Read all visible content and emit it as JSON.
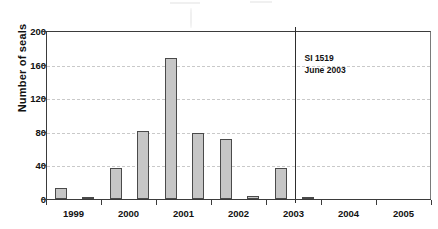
{
  "chart_data": {
    "type": "bar",
    "title": "",
    "xlabel": "",
    "ylabel": "Number of seals",
    "ylim": [
      0,
      200
    ],
    "yticks": [
      0,
      40,
      80,
      120,
      160,
      200
    ],
    "grid": true,
    "legend": null,
    "categories": [
      "1999 H1",
      "1999 H2",
      "2000 H1",
      "2000 H2",
      "2001 H1",
      "2001 H2",
      "2002 H1",
      "2002 H2",
      "2003 H1",
      "2003 H2",
      "2004 H1",
      "2004 H2",
      "2005 H1",
      "2005 H2"
    ],
    "values": [
      13,
      1,
      37,
      81,
      168,
      78,
      71,
      4,
      37,
      1,
      0,
      0,
      0,
      0
    ],
    "xtick_labels": [
      "1999",
      "2000",
      "2001",
      "2002",
      "2003",
      "2004",
      "2005"
    ],
    "annotations": [
      {
        "line1": "SI 1519",
        "line2": "June 2003"
      }
    ],
    "marker_line": {
      "label": "June 2003 divider",
      "at_category": "2003 H2"
    },
    "colors": {
      "bar_fill": "#c6c6c6",
      "bar_border": "#4a4a4a",
      "axis": "#3b3b3b",
      "grid": "#c9c9c9",
      "text": "#111111"
    }
  }
}
